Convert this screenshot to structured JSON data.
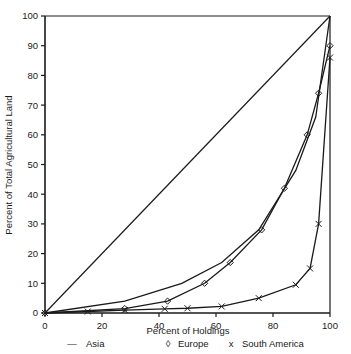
{
  "chart_data": {
    "type": "line",
    "title": "",
    "xlabel": "Percent of Holdings",
    "ylabel": "Percent of Total Agricultural Land",
    "xlim": [
      0,
      100
    ],
    "ylim": [
      0,
      100
    ],
    "xticks": [
      0,
      20,
      40,
      60,
      80,
      100
    ],
    "yticks": [
      0,
      10,
      20,
      30,
      40,
      50,
      60,
      70,
      80,
      90,
      100
    ],
    "grid": false,
    "legend_position": "below",
    "series": [
      {
        "name": "Asia",
        "marker": "line",
        "legend_symbol": "—",
        "x": [
          0,
          28,
          48,
          62,
          75,
          88,
          95,
          100
        ],
        "y": [
          0,
          4,
          10,
          17,
          28,
          48,
          66,
          100
        ]
      },
      {
        "name": "Europe",
        "marker": "diamond",
        "legend_symbol": "◊",
        "x": [
          0,
          28,
          43,
          56,
          65,
          76,
          84,
          92,
          96,
          100
        ],
        "y": [
          0,
          1.5,
          4,
          10,
          17,
          28,
          42,
          60,
          74,
          90
        ]
      },
      {
        "name": "South America",
        "marker": "x",
        "legend_symbol": "x",
        "x": [
          0,
          15,
          28,
          42,
          50,
          62,
          75,
          88,
          93,
          96,
          100
        ],
        "y": [
          0,
          0.5,
          1,
          1.4,
          1.6,
          2.2,
          5,
          9.5,
          15,
          30,
          86
        ]
      },
      {
        "name": "equality-line",
        "marker": "none",
        "legend_symbol": "",
        "x": [
          0,
          100
        ],
        "y": [
          0,
          100
        ]
      }
    ],
    "legend": [
      {
        "symbol": "—",
        "label": "Asia"
      },
      {
        "symbol": "◊",
        "label": "Europe"
      },
      {
        "symbol": "x",
        "label": "South America"
      }
    ],
    "colors": {
      "line": "#1a1a1a",
      "axis": "#1a1a1a",
      "background": "#ffffff"
    }
  }
}
